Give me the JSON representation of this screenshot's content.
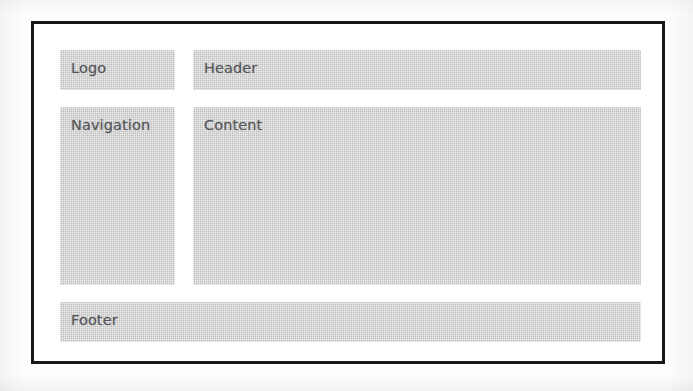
{
  "figure": {
    "kind": "webpage-layout-wireframe",
    "frame_color": "#18181a",
    "block_color": "#c7c7c7",
    "label_color": "#55555a",
    "page_color": "#fdfdfd"
  },
  "blocks": [
    {
      "id": "logo",
      "label": "Logo"
    },
    {
      "id": "header",
      "label": "Header"
    },
    {
      "id": "navigation",
      "label": "Navigation"
    },
    {
      "id": "content",
      "label": "Content"
    },
    {
      "id": "footer",
      "label": "Footer"
    }
  ],
  "labels": {
    "logo": "Logo",
    "header": "Header",
    "navigation": "Navigation",
    "content": "Content",
    "footer": "Footer"
  }
}
